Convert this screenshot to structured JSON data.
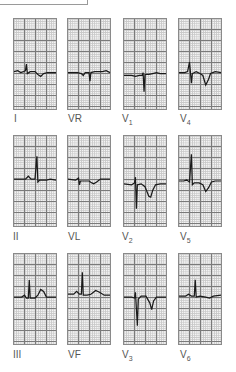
{
  "figure": {
    "type": "12-lead ECG panel grid",
    "rows": [
      [
        {
          "lead": "I",
          "label_main": "I",
          "label_sub": ""
        },
        {
          "lead": "VR",
          "label_main": "VR",
          "label_sub": ""
        },
        {
          "lead": "V1",
          "label_main": "V",
          "label_sub": "1"
        },
        {
          "lead": "V4",
          "label_main": "V",
          "label_sub": "4"
        }
      ],
      [
        {
          "lead": "II",
          "label_main": "II",
          "label_sub": ""
        },
        {
          "lead": "VL",
          "label_main": "VL",
          "label_sub": ""
        },
        {
          "lead": "V2",
          "label_main": "V",
          "label_sub": "2"
        },
        {
          "lead": "V5",
          "label_main": "V",
          "label_sub": "5"
        }
      ],
      [
        {
          "lead": "III",
          "label_main": "III",
          "label_sub": ""
        },
        {
          "lead": "VF",
          "label_main": "VF",
          "label_sub": ""
        },
        {
          "lead": "V3",
          "label_main": "V",
          "label_sub": "3"
        },
        {
          "lead": "V6",
          "label_main": "V",
          "label_sub": "6"
        }
      ]
    ],
    "colors": {
      "trace": "#1a1a1a",
      "grid_major": "#7a7a7a",
      "grid_minor": "#c9c9c9",
      "paper": "#f4f4f4",
      "label": "#555555"
    }
  }
}
